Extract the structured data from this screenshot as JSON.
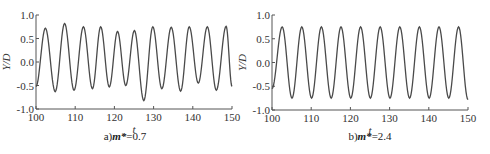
{
  "chart_data": [
    {
      "type": "line",
      "title": "",
      "caption_prefix": "a)",
      "caption_var": "m*",
      "caption_value": "=0.7",
      "xlabel": "t",
      "ylabel": "Y/D",
      "xlim": [
        100,
        150
      ],
      "ylim": [
        -1.0,
        1.0
      ],
      "xticks": [
        "100",
        "110",
        "120",
        "130",
        "140",
        "150"
      ],
      "yticks": [
        "1.0",
        "0.5",
        "0.0",
        "-0.5",
        "-1.0"
      ],
      "grid": false,
      "color": "#4a4a4a",
      "series": [
        {
          "name": "Y/D",
          "extrema": [
            [
              100.0,
              -0.52
            ],
            [
              102.4,
              0.72
            ],
            [
              104.9,
              -0.63
            ],
            [
              107.3,
              0.82
            ],
            [
              109.7,
              -0.6
            ],
            [
              112.1,
              0.75
            ],
            [
              114.4,
              -0.57
            ],
            [
              116.5,
              0.75
            ],
            [
              118.7,
              -0.53
            ],
            [
              120.8,
              0.65
            ],
            [
              122.9,
              -0.5
            ],
            [
              125.1,
              0.67
            ],
            [
              127.5,
              -0.82
            ],
            [
              129.8,
              0.75
            ],
            [
              132.1,
              -0.57
            ],
            [
              134.5,
              0.74
            ],
            [
              136.9,
              -0.62
            ],
            [
              139.1,
              0.75
            ],
            [
              141.4,
              -0.45
            ],
            [
              143.7,
              0.75
            ],
            [
              146.0,
              -0.6
            ],
            [
              148.5,
              0.76
            ],
            [
              150.0,
              -0.52
            ]
          ]
        }
      ]
    },
    {
      "type": "line",
      "title": "",
      "caption_prefix": "b)",
      "caption_var": "m*",
      "caption_value": "=2.4",
      "xlabel": "t",
      "ylabel": "Y/D",
      "xlim": [
        100,
        150
      ],
      "ylim": [
        -1.0,
        1.0
      ],
      "xticks": [
        "100",
        "110",
        "120",
        "130",
        "140",
        "150"
      ],
      "yticks": [
        "1.0",
        "0.5",
        "0.0",
        "-0.5",
        "-1.0"
      ],
      "grid": false,
      "color": "#4a4a4a",
      "series": [
        {
          "name": "Y/D",
          "extrema": [
            [
              100.0,
              -0.55
            ],
            [
              102.6,
              0.75
            ],
            [
              105.1,
              -0.75
            ],
            [
              107.6,
              0.75
            ],
            [
              110.1,
              -0.75
            ],
            [
              112.6,
              0.75
            ],
            [
              115.1,
              -0.75
            ],
            [
              117.6,
              0.75
            ],
            [
              120.1,
              -0.75
            ],
            [
              122.6,
              0.75
            ],
            [
              125.1,
              -0.75
            ],
            [
              127.6,
              0.75
            ],
            [
              130.1,
              -0.75
            ],
            [
              132.6,
              0.75
            ],
            [
              135.1,
              -0.75
            ],
            [
              137.6,
              0.75
            ],
            [
              140.1,
              -0.75
            ],
            [
              142.6,
              0.75
            ],
            [
              145.1,
              -0.75
            ],
            [
              147.6,
              0.75
            ],
            [
              150.0,
              -0.78
            ]
          ]
        }
      ]
    }
  ]
}
